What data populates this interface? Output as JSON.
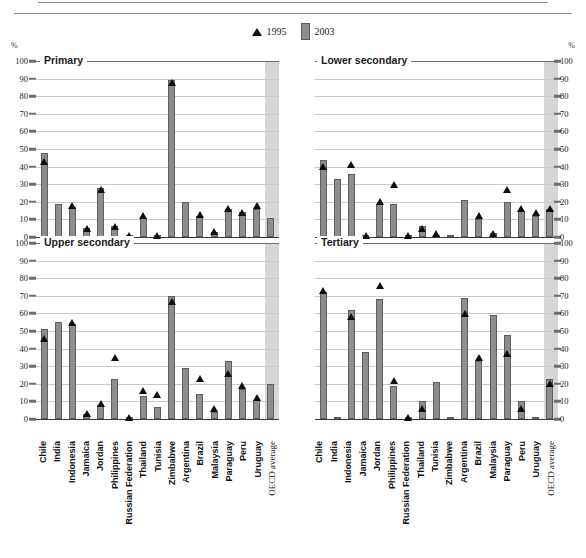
{
  "legend": {
    "items": [
      {
        "label": "1995",
        "marker": "triangle-marker",
        "color": "#0d0d0d"
      },
      {
        "label": "2003",
        "marker": "bar-swatch",
        "color": "#8e8e8e"
      }
    ]
  },
  "axis": {
    "unit_left": "%",
    "unit_right": "%",
    "ticks": [
      0,
      10,
      20,
      30,
      40,
      50,
      60,
      70,
      80,
      90,
      100
    ]
  },
  "colors": {
    "bar_2003": "#8d8d8d",
    "bar_border": "#5e5e5e",
    "marker_1995": "#0d0d0d",
    "gridline": "#c9c9c9",
    "oecd_band": "#d6d6d6"
  },
  "chart_data": {
    "type": "bar",
    "title": "",
    "xlabel": "",
    "ylabel": "%",
    "ylim": [
      0,
      100
    ],
    "grid": true,
    "legend_position": "top-center",
    "categories": [
      "Chile",
      "India",
      "Indonesia",
      "Jamaica",
      "Jordan",
      "Philippines",
      "Russian Federation",
      "Thailand",
      "Tunisia",
      "Zimbabwe",
      "Argentina",
      "Brazil",
      "Malaysia",
      "Paraguay",
      "Peru",
      "Uruguay",
      "OECD average"
    ],
    "panels": [
      {
        "name": "Primary",
        "position": "top-left",
        "series": [
          {
            "name": "2003",
            "values": [
              48,
              19,
              17,
              5,
              28,
              6,
              1,
              11,
              1,
              89,
              20,
              12,
              3,
              16,
              14,
              16,
              11
            ]
          },
          {
            "name": "1995",
            "values": [
              43,
              null,
              18,
              5,
              27,
              6,
              1,
              12,
              1,
              88,
              null,
              13,
              3,
              16,
              14,
              18,
              null
            ]
          }
        ]
      },
      {
        "name": "Lower secondary",
        "position": "top-right",
        "series": [
          {
            "name": "2003",
            "values": [
              44,
              33,
              36,
              1,
              19,
              19,
              0,
              6,
              1,
              0,
              21,
              10,
              2,
              20,
              15,
              12,
              16
            ]
          },
          {
            "name": "1995",
            "values": [
              40,
              null,
              41,
              1,
              20,
              30,
              1,
              5,
              2,
              null,
              null,
              12,
              2,
              27,
              16,
              14,
              16
            ]
          }
        ]
      },
      {
        "name": "Upper secondary",
        "position": "bottom-left",
        "series": [
          {
            "name": "2003",
            "values": [
              51,
              55,
              54,
              3,
              8,
              23,
              0,
              13,
              7,
              70,
              29,
              14,
              4,
              33,
              17,
              11,
              20
            ]
          },
          {
            "name": "1995",
            "values": [
              46,
              null,
              55,
              3,
              9,
              35,
              1,
              16,
              14,
              67,
              null,
              23,
              6,
              26,
              19,
              12,
              null
            ]
          }
        ]
      },
      {
        "name": "Tertiary",
        "position": "bottom-right",
        "series": [
          {
            "name": "2003",
            "values": [
              72,
              1,
              62,
              38,
              68,
              19,
              0,
              10,
              21,
              0,
              69,
              33,
              59,
              48,
              10,
              0,
              23
            ]
          },
          {
            "name": "1995",
            "values": [
              73,
              null,
              58,
              null,
              76,
              22,
              1,
              6,
              null,
              null,
              60,
              35,
              null,
              37,
              6,
              null,
              20
            ]
          }
        ]
      }
    ]
  }
}
